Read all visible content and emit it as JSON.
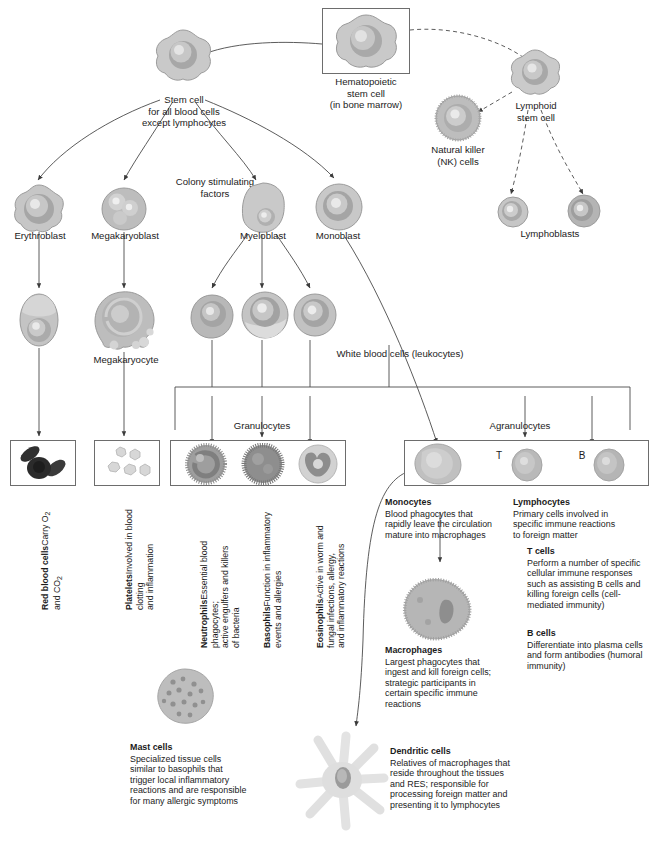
{
  "diagram": {
    "colors": {
      "line": "#4a4a4a",
      "box_border": "#6d6d6d",
      "text": "#1b1b1b",
      "cell_fill": "#b9b9b9",
      "nucleus": "#8f8f8f"
    }
  },
  "nodes": {
    "hematopoietic": "Hematopoietic\nstem cell\n(in bone marrow)",
    "stem_myeloid": "Stem cell\nfor all blood cells\nexcept lymphocytes",
    "colony_factors": "Colony stimulating\nfactors",
    "lymphoid": "Lymphoid\nstem cell",
    "nk": "Natural killer\n(NK) cells",
    "erythroblast": "Erythroblast",
    "megakaryoblast": "Megakaryoblast",
    "myeloblast": "Myeloblast",
    "monoblast": "Monoblast",
    "lymphoblasts": "Lymphoblasts",
    "megakaryocyte": "Megakaryocyte",
    "wbc": "White blood cells (leukocytes)",
    "granulocytes": "Granulocytes",
    "agranulocytes": "Agranulocytes",
    "t_mark": "T",
    "b_mark": "B"
  },
  "vertical_labels": [
    {
      "name": "red-blood-cells",
      "title": "Red blood cells",
      "body": "Carry O₂ and CO₂"
    },
    {
      "name": "platelets",
      "title": "Platelets",
      "body": "Involved in blood clotting\nand inflammation"
    },
    {
      "name": "neutrophils",
      "title": "Neutrophils",
      "body": "Essential blood phagocytes;\nactive engulfers and killers\nof bacteria"
    },
    {
      "name": "basophils",
      "title": "Basophils",
      "body": "Function in inflammatory\nevents and allergies"
    },
    {
      "name": "eosinophils",
      "title": "Eosinophils",
      "body": "Active in worm and\nfungal infections, allergy,\nand inflammatory reactions"
    }
  ],
  "text_blocks": [
    {
      "name": "monocytes",
      "title": "Monocytes",
      "body": "Blood phagocytes that\nrapidly leave the circulation\nmature into macrophages"
    },
    {
      "name": "lymphocytes",
      "title": "Lymphocytes",
      "body": "Primary cells involved in\nspecific immune reactions\nto foreign matter"
    },
    {
      "name": "t-cells",
      "title": "T cells",
      "body": "Perform a number of specific\ncellular immune responses\nsuch as assisting B cells and\nkilling foreign cells (cell-\nmediated immunity)"
    },
    {
      "name": "b-cells",
      "title": "B cells",
      "body": "Differentiate into plasma cells\nand form antibodies (humoral\nimmunity)"
    },
    {
      "name": "macrophages",
      "title": "Macrophages",
      "body": "Largest phagocytes that\ningest and kill foreign cells;\nstrategic participants in\ncertain specific immune\nreactions"
    },
    {
      "name": "mast-cells",
      "title": "Mast cells",
      "body": "Specialized tissue cells\nsimilar to basophils that\ntrigger local inflammatory\nreactions and are responsible\nfor many allergic symptoms"
    },
    {
      "name": "dendritic-cells",
      "title": "Dendritic cells",
      "body": "Relatives of macrophages that\nreside throughout the tissues\nand RES; responsible for\nprocessing foreign matter and\npresenting it to lymphocytes"
    }
  ]
}
